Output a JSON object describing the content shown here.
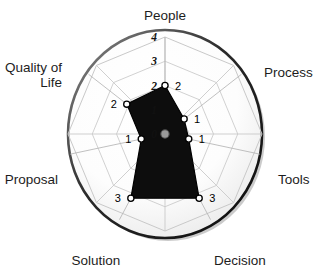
{
  "chart_data": {
    "type": "radar",
    "title": "",
    "categories": [
      "People",
      "Process",
      "Tools",
      "Decision",
      "Solution",
      "Proposal",
      "Quality of Life"
    ],
    "values": [
      2,
      1,
      1,
      3,
      3,
      1,
      2
    ],
    "series": [
      {
        "name": "Assessment",
        "values": [
          2,
          1,
          1,
          3,
          3,
          1,
          2
        ]
      }
    ],
    "ring_ticks": [
      "0",
      "1",
      "2",
      "3",
      "4"
    ],
    "rlim": [
      0,
      4
    ],
    "grid": true,
    "legend": "none",
    "xlabel": "",
    "ylabel": "",
    "colors": {
      "series_fill": "#0d0d0d",
      "series_stroke": "#000000",
      "grid_line": "#c9c9c9",
      "outer_circle": "#1a1a1a",
      "plot_background": "#ffffff",
      "shade_background": "#ededed",
      "marker_fill": "#ffffff",
      "marker_stroke": "#000000",
      "center_marker": "#9a9a9a",
      "label_text": "#1d1d1d",
      "tick_text": "#111111"
    }
  },
  "axes": [
    {
      "label": "People",
      "value": 2,
      "value_label": "2",
      "angle_deg": 90,
      "label_lines": [
        "People"
      ]
    },
    {
      "label": "Process",
      "value": 1,
      "value_label": "1",
      "angle_deg": 38,
      "label_lines": [
        "Process"
      ]
    },
    {
      "label": "Tools",
      "value": 1,
      "value_label": "1",
      "angle_deg": -12,
      "label_lines": [
        "Tools"
      ]
    },
    {
      "label": "Decision",
      "value": 3,
      "value_label": "3",
      "angle_deg": -62,
      "label_lines": [
        "Decision"
      ]
    },
    {
      "label": "Solution",
      "value": 3,
      "value_label": "3",
      "angle_deg": -118,
      "label_lines": [
        "Solution"
      ]
    },
    {
      "label": "Proposal",
      "value": 1,
      "value_label": "1",
      "angle_deg": 192,
      "label_lines": [
        "Proposal"
      ]
    },
    {
      "label": "Quality of Life",
      "value": 2,
      "value_label": "2",
      "angle_deg": 142,
      "label_lines": [
        "Quality of",
        "Life"
      ]
    }
  ],
  "ring_tick_labels": [
    {
      "text": "4",
      "radius": 4
    },
    {
      "text": "3",
      "radius": 3
    },
    {
      "text": "2",
      "radius": 2
    },
    {
      "text": "1",
      "radius": 1
    },
    {
      "text": "0",
      "radius": 0
    }
  ],
  "geometry": {
    "center_x": 165,
    "center_y": 134,
    "outer_radius": 97,
    "max_value": 4
  }
}
